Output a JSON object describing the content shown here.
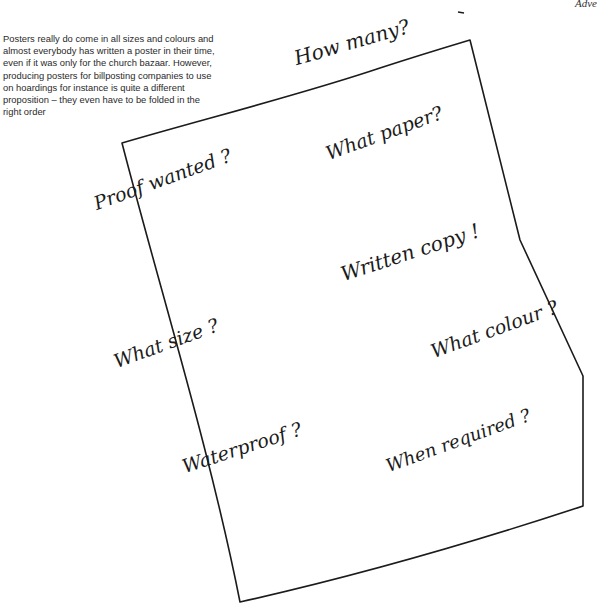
{
  "page": {
    "running_head": "Adve",
    "caption": "Posters really do come in all sizes and colours and almost everybody has written a poster in their time, even if it was only for the church bazaar. However, producing posters for billposting companies to use on hoardings for instance is quite a different proposition – they even have to be folded in the right order"
  },
  "poster_sketch": {
    "corners": {
      "top_left": [
        122,
        143
      ],
      "top_right": [
        470,
        40
      ],
      "bottom_right": [
        583,
        506
      ],
      "bottom_left": [
        240,
        602
      ]
    },
    "stroke_color": "#1b1b1b",
    "labels": [
      {
        "id": "how-many",
        "text": "How many?"
      },
      {
        "id": "proof-wanted",
        "text": "Proof wanted ?"
      },
      {
        "id": "what-paper",
        "text": "What paper?"
      },
      {
        "id": "written-copy",
        "text": "Written copy !"
      },
      {
        "id": "what-size",
        "text": "What size ?"
      },
      {
        "id": "what-colour",
        "text": "What colour ?"
      },
      {
        "id": "waterproof",
        "text": "Waterproof ?"
      },
      {
        "id": "when-required",
        "text": "When required ?"
      }
    ]
  }
}
